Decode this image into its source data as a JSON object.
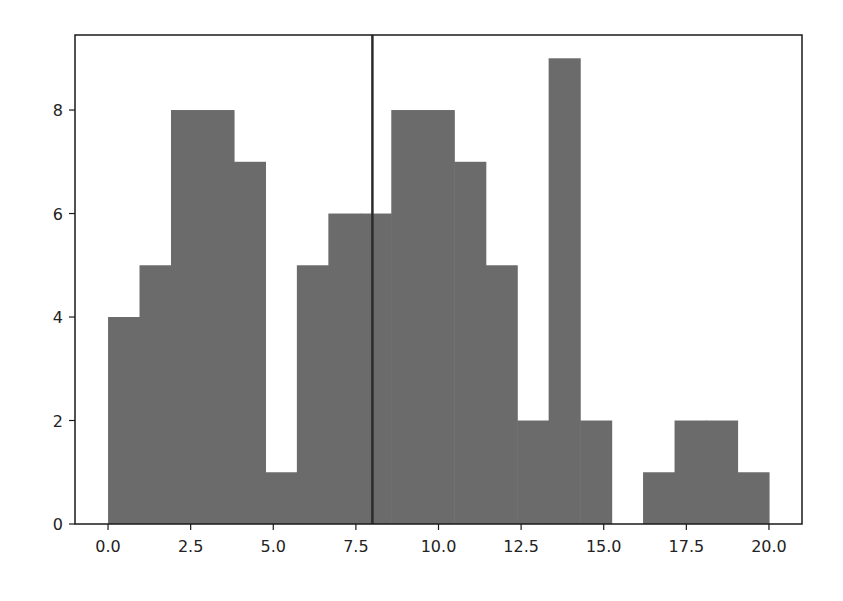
{
  "chart_data": {
    "type": "bar",
    "subtype": "histogram",
    "title": "",
    "xlabel": "",
    "ylabel": "",
    "bins": {
      "start": 0.0,
      "end": 20.0,
      "count": 21
    },
    "bin_edges": [
      0.0,
      0.952,
      1.905,
      2.857,
      3.81,
      4.762,
      5.714,
      6.667,
      7.619,
      8.571,
      9.524,
      10.476,
      11.429,
      12.381,
      13.333,
      14.286,
      15.238,
      16.19,
      17.143,
      18.095,
      19.048,
      20.0
    ],
    "values": [
      4,
      5,
      8,
      8,
      7,
      1,
      5,
      6,
      6,
      8,
      8,
      7,
      5,
      2,
      9,
      2,
      0,
      1,
      2,
      2,
      1
    ],
    "xlim": [
      -1.0,
      21.0
    ],
    "ylim": [
      0,
      9.45
    ],
    "xticks": [
      0.0,
      2.5,
      5.0,
      7.5,
      10.0,
      12.5,
      15.0,
      17.5,
      20.0
    ],
    "xtick_labels": [
      "0.0",
      "2.5",
      "5.0",
      "7.5",
      "10.0",
      "12.5",
      "15.0",
      "17.5",
      "20.0"
    ],
    "yticks": [
      0,
      2,
      4,
      6,
      8
    ],
    "ytick_labels": [
      "0",
      "2",
      "4",
      "6",
      "8"
    ],
    "vline": {
      "x": 8.0,
      "color": "#2b2b2b"
    },
    "bar_color": "#6b6b6b",
    "grid": false,
    "legend": null
  }
}
